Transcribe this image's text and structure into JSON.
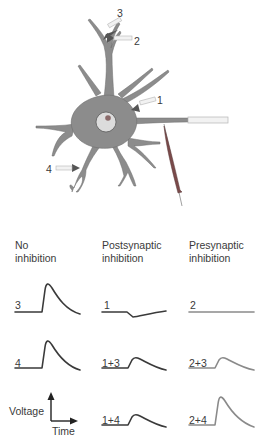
{
  "figure": {
    "neuron": {
      "synapse_labels": [
        "1",
        "2",
        "3",
        "4"
      ],
      "colors": {
        "cell_body": "#8c8c8c",
        "cell_outline": "#6a6a6a",
        "nucleus": "#dcdcdc",
        "nucleolus": "#8a6a6a",
        "terminal": "#555555",
        "axon_tube": "#e8e8e8",
        "electrode": "#7a4a4a"
      }
    },
    "columns": [
      {
        "header_line1": "No",
        "header_line2": "inhibition"
      },
      {
        "header_line1": "Postsynaptic",
        "header_line2": "inhibition"
      },
      {
        "header_line1": "Presynaptic",
        "header_line2": "inhibition"
      }
    ],
    "traces": [
      {
        "label": "3",
        "column": 0,
        "row": 0,
        "shape": "large-epsp",
        "color": "#3a3a3a"
      },
      {
        "label": "4",
        "column": 0,
        "row": 1,
        "shape": "large-epsp",
        "color": "#3a3a3a"
      },
      {
        "label": "1",
        "column": 1,
        "row": 0,
        "shape": "ipsp",
        "color": "#3a3a3a"
      },
      {
        "label": "1+3",
        "column": 1,
        "row": 1,
        "shape": "small-epsp",
        "color": "#3a3a3a"
      },
      {
        "label": "1+4",
        "column": 1,
        "row": 2,
        "shape": "small-epsp",
        "color": "#3a3a3a"
      },
      {
        "label": "2",
        "column": 2,
        "row": 0,
        "shape": "flat",
        "color": "#8a8a8a"
      },
      {
        "label": "2+3",
        "column": 2,
        "row": 1,
        "shape": "small-epsp",
        "color": "#8a8a8a"
      },
      {
        "label": "2+4",
        "column": 2,
        "row": 2,
        "shape": "large-epsp",
        "color": "#8a8a8a"
      }
    ],
    "axes_legend": {
      "y_label": "Voltage",
      "x_label": "Time"
    }
  }
}
